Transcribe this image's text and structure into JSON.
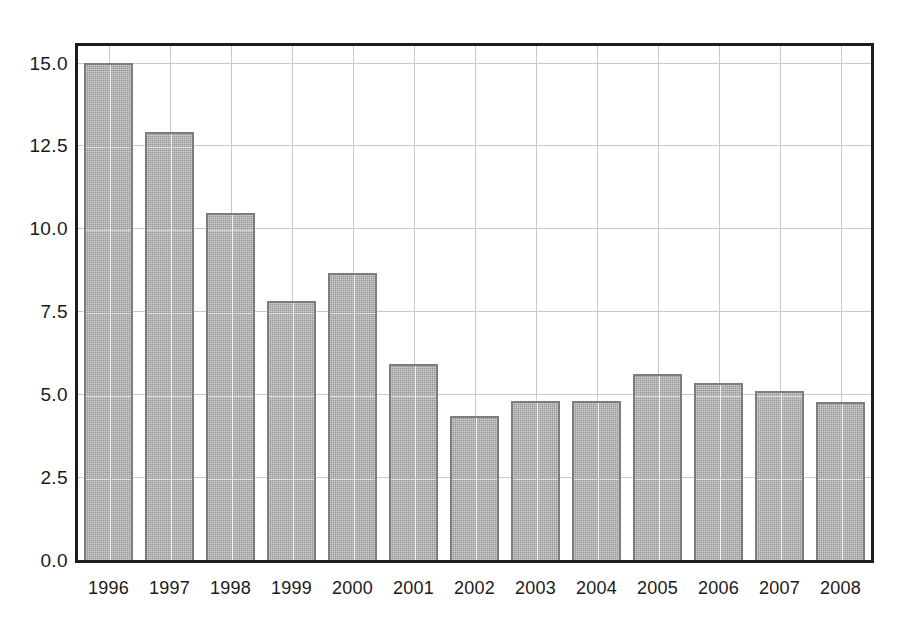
{
  "chart_data": {
    "type": "bar",
    "title": "",
    "subtitle": "",
    "xlabel": "",
    "ylabel": "",
    "categories": [
      "1996",
      "1997",
      "1998",
      "1999",
      "2000",
      "2001",
      "2002",
      "2003",
      "2004",
      "2005",
      "2006",
      "2007",
      "2008"
    ],
    "values": [
      15.0,
      12.9,
      10.45,
      7.8,
      8.65,
      5.9,
      4.35,
      4.8,
      4.8,
      5.6,
      5.35,
      5.1,
      4.75
    ],
    "ylim": [
      0.0,
      15.5
    ],
    "xlim": [
      0,
      13
    ],
    "yticks": [
      0.0,
      2.5,
      5.0,
      7.5,
      10.0,
      12.5,
      15.0
    ],
    "ytick_labels": [
      "0.0",
      "2.5",
      "5.0",
      "7.5",
      "10.0",
      "12.5",
      "15.0"
    ],
    "xtick_labels": [
      "1996",
      "1997",
      "1998",
      "1999",
      "2000",
      "2001",
      "2002",
      "2003",
      "2004",
      "2005",
      "2006",
      "2007",
      "2008"
    ],
    "grid": true,
    "grid_axis": "both",
    "legend": null,
    "legend_position": "none",
    "annotations": [],
    "series": [
      {
        "name": "",
        "values": [
          15.0,
          12.9,
          10.45,
          7.8,
          8.65,
          5.9,
          4.35,
          4.8,
          4.8,
          5.6,
          5.35,
          5.1,
          4.75
        ]
      }
    ]
  },
  "style": {
    "bar_fill_color": "#a9a9a9",
    "bar_border_color": "#7d7d7d",
    "frame_color": "#1c1c1c",
    "grid_color": "#c9c9c9",
    "background_color": "#ffffff",
    "text_color": "#1a1a1a"
  }
}
